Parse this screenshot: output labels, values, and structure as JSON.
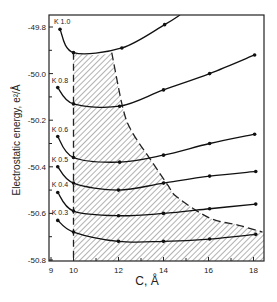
{
  "chart_data": {
    "type": "line",
    "title": "",
    "xlabel": "C, Å",
    "ylabel": "Electrostatic energy, e²/Å",
    "xlim": [
      9,
      18.5
    ],
    "ylim": [
      -50.8,
      -49.75
    ],
    "xticks": [
      9,
      10,
      12,
      14,
      16,
      18
    ],
    "xtick_labels": [
      "9",
      "10",
      "12",
      "14",
      "16",
      "18"
    ],
    "yticks": [
      -49.8,
      -50.0,
      -50.2,
      -50.4,
      -50.6,
      -50.8
    ],
    "ytick_labels": [
      "-49.8",
      "-50.0",
      "-50.2",
      "-50.4",
      "-50.6",
      "-50.8"
    ],
    "grid": false,
    "legend": "inline labels at curve starts",
    "series": [
      {
        "name": "K 1.0",
        "x": [
          9.4,
          10.0,
          12.15,
          14.05
        ],
        "y": [
          -49.81,
          -49.91,
          -49.89,
          -49.79
        ]
      },
      {
        "name": "K 0.8",
        "x": [
          9.3,
          10.0,
          12.05,
          14.0,
          16.05,
          18.05
        ],
        "y": [
          -50.06,
          -50.13,
          -50.14,
          -50.07,
          -50.0,
          -49.92
        ]
      },
      {
        "name": "K 0.6",
        "x": [
          9.3,
          10.0,
          12.05,
          14.0,
          16.05,
          18.05
        ],
        "y": [
          -50.27,
          -50.36,
          -50.38,
          -50.35,
          -50.3,
          -50.26
        ]
      },
      {
        "name": "K 0.5",
        "x": [
          9.3,
          10.0,
          12.0,
          14.0,
          16.05,
          18.1
        ],
        "y": [
          -50.4,
          -50.47,
          -50.5,
          -50.47,
          -50.44,
          -50.42
        ]
      },
      {
        "name": "K 0.4",
        "x": [
          9.3,
          10.0,
          12.0,
          14.0,
          16.05,
          18.1
        ],
        "y": [
          -50.51,
          -50.59,
          -50.61,
          -50.6,
          -50.58,
          -50.56
        ]
      },
      {
        "name": "K 0.3",
        "x": [
          9.3,
          10.0,
          12.0,
          14.0,
          16.05,
          18.1
        ],
        "y": [
          -50.63,
          -50.68,
          -50.72,
          -50.72,
          -50.71,
          -50.69
        ]
      }
    ],
    "annotations": [
      {
        "type": "dashed-vertical-line",
        "x": 10.0,
        "from_y": -49.91,
        "to_y": -50.8
      },
      {
        "type": "dashed-boundary-curve",
        "points": [
          [
            11.7,
            -49.91
          ],
          [
            12.2,
            -50.15
          ],
          [
            12.6,
            -50.25
          ],
          [
            13.5,
            -50.38
          ],
          [
            14.2,
            -50.48
          ],
          [
            14.6,
            -50.53
          ],
          [
            16.05,
            -50.62
          ],
          [
            17.3,
            -50.65
          ],
          [
            18.4,
            -50.68
          ]
        ]
      },
      {
        "type": "hatched-region",
        "description": "region bounded by C=10 dashed line, K 1.0 curve, dashed boundary curve and x-axis"
      }
    ]
  },
  "labels": {
    "x_axis_title": "C, Å",
    "y_axis_title": "Electrostatic energy, e²/Å"
  }
}
